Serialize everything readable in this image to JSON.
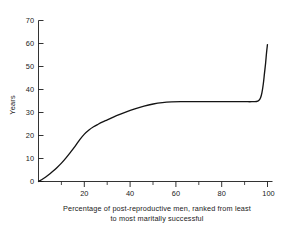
{
  "chart_data": {
    "type": "line",
    "title": "",
    "subtitle": "",
    "xlabel_line1": "Percentage of post-reproductive men, ranked from least",
    "xlabel_line2": "to most maritally successful",
    "ylabel": "Years",
    "xlim": [
      0,
      102
    ],
    "ylim": [
      0,
      70
    ],
    "grid": false,
    "legend": false,
    "x_ticks_major": [
      20,
      40,
      60,
      80,
      100
    ],
    "x_tick_labels": [
      "20",
      "40",
      "60",
      "80",
      "100"
    ],
    "x_ticks_minor": [
      10,
      30,
      50,
      70,
      90
    ],
    "y_ticks_major": [
      0,
      10,
      20,
      30,
      40,
      50,
      60,
      70
    ],
    "y_tick_labels": [
      "0",
      "10",
      "20",
      "30",
      "40",
      "50",
      "60",
      "70"
    ],
    "series": [
      {
        "name": "Years of marital success",
        "x": [
          0,
          2,
          4,
          6,
          8,
          10,
          12,
          14,
          16,
          18,
          20,
          22,
          24,
          26,
          28,
          30,
          34,
          38,
          42,
          46,
          50,
          54,
          58,
          62,
          66,
          70,
          74,
          78,
          82,
          86,
          90,
          93,
          95,
          96,
          96.8,
          97.4,
          98,
          98.5,
          99,
          99.4,
          99.8
        ],
        "values": [
          0,
          1.2,
          2.6,
          4.2,
          6.0,
          8.0,
          10.3,
          12.8,
          15.4,
          18.2,
          20.6,
          22.4,
          23.8,
          24.9,
          25.9,
          26.8,
          28.6,
          30.2,
          31.6,
          32.8,
          33.7,
          34.3,
          34.6,
          34.7,
          34.7,
          34.7,
          34.7,
          34.7,
          34.7,
          34.7,
          34.7,
          34.7,
          34.8,
          35.2,
          36.4,
          38.6,
          42.5,
          47.0,
          51.5,
          56.0,
          59.5
        ]
      }
    ],
    "annotations": {
      "plateau_value": 34.7,
      "peak_value": 59.5,
      "inflection_x": 21
    }
  }
}
